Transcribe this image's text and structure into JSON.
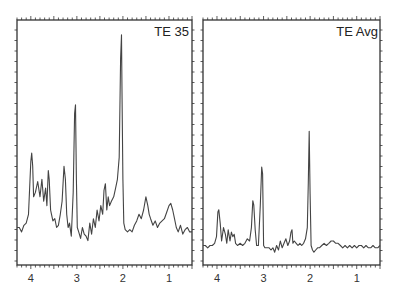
{
  "chart_data": [
    {
      "type": "line",
      "title": "TE 35",
      "xlabel": "",
      "ylabel": "",
      "x_reversed": true,
      "xlim": [
        4.3,
        0.5
      ],
      "ylim": [
        0,
        100
      ],
      "xticks": [
        4,
        3,
        2,
        1
      ],
      "xtick_labels": [
        "4",
        "3",
        "2",
        "1"
      ],
      "grid": false,
      "legend": null,
      "peaks_ppm": [
        {
          "ppm": 3.97,
          "height": 40
        },
        {
          "ppm": 3.75,
          "height": 30
        },
        {
          "ppm": 3.64,
          "height": 30
        },
        {
          "ppm": 3.56,
          "height": 35
        },
        {
          "ppm": 3.22,
          "height": 37
        },
        {
          "ppm": 3.03,
          "height": 62
        },
        {
          "ppm": 2.38,
          "height": 26
        },
        {
          "ppm": 2.3,
          "height": 21
        },
        {
          "ppm": 2.13,
          "height": 28
        },
        {
          "ppm": 2.02,
          "height": 95
        },
        {
          "ppm": 1.45,
          "height": 15
        },
        {
          "ppm": 0.95,
          "height": 13
        }
      ],
      "series": [
        {
          "name": "TE 35",
          "x": [
            4.3,
            4.25,
            4.2,
            4.15,
            4.1,
            4.05,
            4.0,
            3.98,
            3.96,
            3.94,
            3.9,
            3.85,
            3.8,
            3.76,
            3.72,
            3.68,
            3.65,
            3.62,
            3.6,
            3.57,
            3.55,
            3.52,
            3.48,
            3.44,
            3.4,
            3.36,
            3.32,
            3.28,
            3.25,
            3.22,
            3.19,
            3.16,
            3.12,
            3.08,
            3.05,
            3.03,
            3.01,
            2.99,
            2.96,
            2.92,
            2.88,
            2.84,
            2.8,
            2.76,
            2.72,
            2.68,
            2.64,
            2.6,
            2.56,
            2.52,
            2.48,
            2.44,
            2.41,
            2.38,
            2.35,
            2.32,
            2.29,
            2.25,
            2.2,
            2.16,
            2.12,
            2.08,
            2.05,
            2.03,
            2.02,
            2.0,
            1.98,
            1.95,
            1.9,
            1.85,
            1.8,
            1.75,
            1.7,
            1.65,
            1.6,
            1.55,
            1.5,
            1.46,
            1.43,
            1.4,
            1.35,
            1.3,
            1.25,
            1.2,
            1.15,
            1.1,
            1.05,
            1.0,
            0.96,
            0.92,
            0.88,
            0.84,
            0.8,
            0.75,
            0.7,
            0.65,
            0.6,
            0.55,
            0.5
          ],
          "y": [
            8,
            8,
            6,
            9,
            10,
            14,
            38,
            42,
            36,
            22,
            24,
            29,
            22,
            30,
            20,
            26,
            18,
            34,
            30,
            16,
            14,
            11,
            12,
            8,
            9,
            14,
            20,
            36,
            30,
            14,
            8,
            10,
            4,
            24,
            60,
            64,
            30,
            8,
            6,
            3,
            8,
            5,
            4,
            2,
            10,
            5,
            12,
            8,
            16,
            11,
            18,
            14,
            25,
            28,
            16,
            22,
            18,
            20,
            22,
            26,
            30,
            40,
            85,
            96,
            70,
            30,
            10,
            7,
            6,
            7,
            6,
            9,
            11,
            14,
            12,
            16,
            22,
            18,
            14,
            12,
            9,
            11,
            8,
            10,
            11,
            12,
            15,
            18,
            19,
            16,
            12,
            8,
            6,
            9,
            5,
            7,
            8,
            6,
            6
          ]
        }
      ]
    },
    {
      "type": "line",
      "title": "TE Avg",
      "xlabel": "",
      "ylabel": "",
      "x_reversed": true,
      "xlim": [
        4.3,
        0.5
      ],
      "ylim": [
        0,
        100
      ],
      "xticks": [
        4,
        3,
        2,
        1
      ],
      "xtick_labels": [
        "4",
        "3",
        "2",
        "1"
      ],
      "grid": false,
      "legend": null,
      "peaks_ppm": [
        {
          "ppm": 3.97,
          "height": 18
        },
        {
          "ppm": 3.8,
          "height": 8
        },
        {
          "ppm": 3.67,
          "height": 8
        },
        {
          "ppm": 3.22,
          "height": 22
        },
        {
          "ppm": 3.03,
          "height": 37
        },
        {
          "ppm": 2.38,
          "height": 8
        },
        {
          "ppm": 2.02,
          "height": 53
        },
        {
          "ppm": 1.45,
          "height": 4
        }
      ],
      "series": [
        {
          "name": "TE Avg",
          "x": [
            4.3,
            4.25,
            4.2,
            4.15,
            4.1,
            4.05,
            4.01,
            3.98,
            3.96,
            3.93,
            3.9,
            3.86,
            3.82,
            3.79,
            3.76,
            3.72,
            3.69,
            3.66,
            3.63,
            3.6,
            3.56,
            3.5,
            3.45,
            3.4,
            3.35,
            3.3,
            3.26,
            3.23,
            3.21,
            3.18,
            3.15,
            3.11,
            3.07,
            3.04,
            3.02,
            3.0,
            2.97,
            2.93,
            2.88,
            2.84,
            2.8,
            2.76,
            2.72,
            2.68,
            2.64,
            2.6,
            2.56,
            2.52,
            2.48,
            2.44,
            2.41,
            2.39,
            2.37,
            2.34,
            2.3,
            2.26,
            2.22,
            2.18,
            2.14,
            2.1,
            2.06,
            2.04,
            2.02,
            2.0,
            1.98,
            1.95,
            1.92,
            1.88,
            1.84,
            1.8,
            1.75,
            1.7,
            1.65,
            1.6,
            1.55,
            1.5,
            1.45,
            1.4,
            1.35,
            1.3,
            1.25,
            1.2,
            1.15,
            1.1,
            1.05,
            1.0,
            0.95,
            0.9,
            0.85,
            0.8,
            0.75,
            0.7,
            0.65,
            0.6,
            0.55,
            0.5
          ],
          "y": [
            2,
            2,
            1,
            2,
            2,
            3,
            6,
            17,
            18,
            12,
            4,
            10,
            7,
            3,
            9,
            4,
            8,
            6,
            7,
            3,
            2,
            3,
            2,
            3,
            5,
            4,
            10,
            22,
            20,
            9,
            2,
            2,
            20,
            37,
            34,
            2,
            1,
            1,
            1,
            0,
            1,
            -1,
            2,
            0,
            4,
            1,
            3,
            5,
            2,
            4,
            8,
            9,
            3,
            4,
            3,
            2,
            3,
            2,
            3,
            5,
            10,
            30,
            53,
            25,
            2,
            0,
            -1,
            0,
            1,
            1,
            2,
            3,
            2,
            3,
            4,
            4,
            3,
            3,
            2,
            1,
            2,
            1,
            2,
            1,
            2,
            1,
            2,
            2,
            1,
            2,
            1,
            1,
            2,
            1,
            1,
            2
          ]
        }
      ]
    }
  ],
  "panels": [
    {
      "title": "TE 35"
    },
    {
      "title": "TE Avg"
    }
  ]
}
